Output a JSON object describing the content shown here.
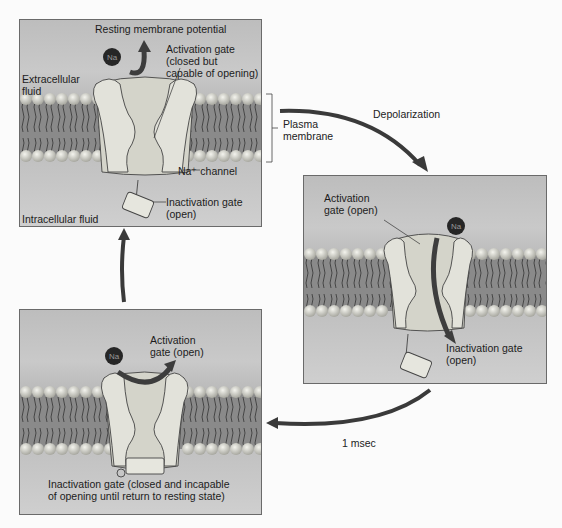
{
  "panels": {
    "resting": {
      "title": "Resting membrane potential",
      "activation_gate": "Activation gate\n(closed but\ncapable of opening)",
      "extracellular": "Extracellular\nfluid",
      "channel": "Na⁺ channel",
      "inactivation_gate": "Inactivation gate\n(open)",
      "intracellular": "Intracellular fluid",
      "ion": "Na"
    },
    "depolarized": {
      "activation_gate": "Activation\ngate (open)",
      "inactivation_gate": "Inactivation gate\n(open)",
      "ion": "Na"
    },
    "inactivated": {
      "activation_gate": "Activation\ngate (open)",
      "inactivation_gate": "Inactivation gate (closed and incapable\nof opening until return to resting state)",
      "ion": "Na"
    }
  },
  "annotations": {
    "plasma_membrane": "Plasma\nmembrane",
    "depolarization": "Depolarization",
    "time": "1 msec"
  },
  "colors": {
    "background": "#fbfbfb",
    "panel_fill": "#c2c2c2",
    "panel_border": "#6a6a6a",
    "lipid_head": "#d8d8d0",
    "channel_fill": "#dcdcd2",
    "ion_fill": "#2a2a2a",
    "arrow": "#3a3a3a"
  }
}
